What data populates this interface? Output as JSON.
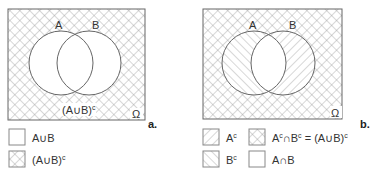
{
  "panel_a": {
    "tag": "a.",
    "set_labels": {
      "a": "A",
      "b": "B",
      "universe": "Ω"
    },
    "region_label": {
      "base": "(A∪B)",
      "sup": "c"
    },
    "legend": [
      {
        "pattern": "blank",
        "base": "A∪B",
        "sup": ""
      },
      {
        "pattern": "crosshatch",
        "base": "(A∪B)",
        "sup": "c"
      }
    ]
  },
  "panel_b": {
    "tag": "b.",
    "set_labels": {
      "a": "A",
      "b": "B",
      "universe": "Ω"
    },
    "legend": [
      {
        "pattern": "forward-hatch",
        "base": "A",
        "sup": "c"
      },
      {
        "pattern": "crosshatch",
        "part1": "A",
        "sup1": "c",
        "op": "∩B",
        "sup2": "c",
        "eq": " = (A∪B)",
        "sup3": "c"
      },
      {
        "pattern": "back-hatch",
        "base": "B",
        "sup": "c"
      },
      {
        "pattern": "blank",
        "base": "A∩B",
        "sup": ""
      }
    ]
  },
  "colors": {
    "line": "#666666",
    "hatch": "#9a9a9a",
    "background": "#ffffff"
  }
}
